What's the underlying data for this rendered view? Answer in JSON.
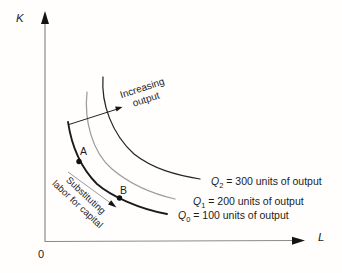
{
  "figure": {
    "axes": {
      "y_label": "K",
      "x_label": "L",
      "origin_label": "0"
    },
    "points": {
      "a": "A",
      "b": "B"
    },
    "annotations": {
      "increasing_output": {
        "line1": "Increasing",
        "line2": "output"
      },
      "substitution": {
        "line1": "Substituting",
        "line2": "labor for capital"
      }
    },
    "isoquants": [
      {
        "symbol": "Q",
        "subscript": "0",
        "rest": " = 100 units of output",
        "color": "#1a1a1a"
      },
      {
        "symbol": "Q",
        "subscript": "1",
        "rest": " = 200 units of output",
        "color": "#9c9c9c"
      },
      {
        "symbol": "Q",
        "subscript": "2",
        "rest": " = 300 units of output",
        "color": "#262626"
      }
    ],
    "colors": {
      "axis": "#8a8a8a",
      "arrowhead": "#141414",
      "increasing_arrow_stem": "#222222",
      "substitution_arrow_stem": "#9a9a9a",
      "point_marker": "#111111"
    }
  }
}
